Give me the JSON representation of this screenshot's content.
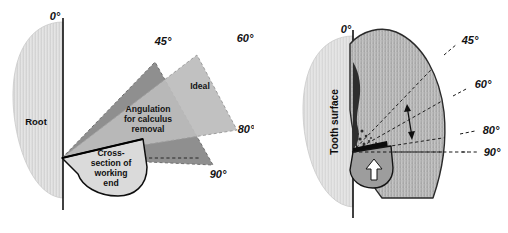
{
  "figure": {
    "panels": [
      {
        "id": "left",
        "name": "angulation-schematic",
        "labels": {
          "zero": "0°",
          "fortyfive": "45°",
          "sixty": "60°",
          "eighty": "80°",
          "ninety": "90°",
          "root": "Root",
          "ideal": "Ideal",
          "angulation_line1": "Angulation",
          "angulation_line2": "for calculus",
          "angulation_line3": "removal",
          "cross_line1": "Cross-",
          "cross_line2": "section of",
          "cross_line3": "working",
          "cross_line4": "end"
        }
      },
      {
        "id": "right",
        "name": "clinical-application",
        "labels": {
          "zero": "0°",
          "fortyfive": "45°",
          "sixty": "60°",
          "eighty": "80°",
          "ninety": "90°",
          "tooth_surface": "Tooth surface"
        }
      }
    ]
  },
  "colors": {
    "root_fill": "#dcdcdc",
    "root_edge": "#c4c4c4",
    "wedge_dark": "#8f8f8f",
    "wedge_light": "#bcbcbc",
    "blade_fill": "#b3b3b3",
    "blade_edge": "#2a2a2a",
    "calculus": "#2e2e2e",
    "instrument_fill": "#d7d7d7",
    "instrument_edge": "#111111",
    "dash_line": "#1a1a1a",
    "axis_line": "#111111",
    "background": "#ffffff",
    "text": "#121212"
  },
  "geometry": {
    "left_apex": {
      "x": 62,
      "y": 158
    },
    "right_apex": {
      "x": 98,
      "y": 152
    },
    "angles_deg": [
      0,
      45,
      60,
      80,
      90
    ],
    "wedge_calculus_range": [
      45,
      90
    ],
    "wedge_ideal_range": [
      60,
      80
    ]
  }
}
